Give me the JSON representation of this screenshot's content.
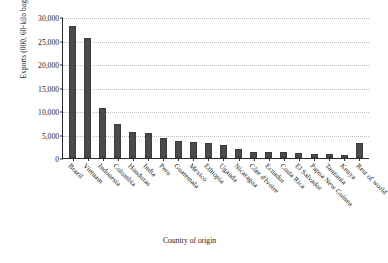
{
  "chart_data": {
    "type": "bar",
    "title": "",
    "xlabel": "Country of origin",
    "ylabel": "Exports (000, 60-kilo bags)",
    "categories": [
      "Brazil",
      "Vietnam",
      "Indonesia",
      "Colombia",
      "Honduras",
      "India",
      "Peru",
      "Guatemala",
      "Mexico",
      "Ethiopia",
      "Uganda",
      "Nicaragua",
      "Côte d'Ivoire",
      "Ecuador",
      "Costa Rica",
      "El Salvador",
      "Papua New Guinea",
      "Tanzania",
      "Kenya",
      "Rest of world"
    ],
    "values": [
      28000,
      25500,
      10700,
      7200,
      5500,
      5350,
      4300,
      3700,
      3400,
      3100,
      2700,
      2000,
      1300,
      1250,
      1200,
      1150,
      900,
      800,
      650,
      3100
    ],
    "ylim": [
      0,
      30000
    ],
    "yticks": [
      "0",
      "5,000",
      "10,000",
      "15,000",
      "20,000",
      "25,000",
      "30,000"
    ],
    "ytick_values": [
      0,
      5000,
      10000,
      15000,
      20000,
      25000,
      30000
    ],
    "grid": true,
    "legend": false,
    "bar_color": "#4a4a4a"
  }
}
